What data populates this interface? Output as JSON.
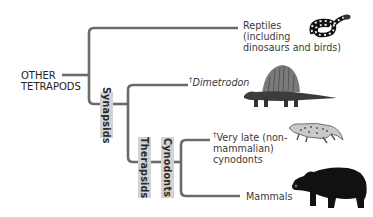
{
  "diagram": {
    "type": "phylogenetic-tree",
    "root": {
      "label_line1": "OTHER",
      "label_line2": "TETRAPODS"
    },
    "clades": [
      {
        "name": "Synapsids"
      },
      {
        "name": "Therapsids"
      },
      {
        "name": "Cynodonts"
      }
    ],
    "tips": [
      {
        "id": "reptiles",
        "extinct": false,
        "lines": [
          "Reptiles",
          "(including",
          "dinosaurs and birds)"
        ],
        "image": "snake"
      },
      {
        "id": "dimetrodon",
        "extinct": true,
        "dagger": "†",
        "lines": [
          "Dimetrodon"
        ],
        "italic": true,
        "image": "dimetrodon"
      },
      {
        "id": "very-late-cynodonts",
        "extinct": true,
        "dagger": "†",
        "lines": [
          "Very late (non-",
          "mammalian)",
          "cynodonts"
        ],
        "image": "cynodont"
      },
      {
        "id": "mammals",
        "extinct": false,
        "lines": [
          "Mammals"
        ],
        "image": "bear"
      }
    ],
    "colors": {
      "branch": "#6b6b6b",
      "clade_box": "#d3d3d3",
      "text": "#3a3a3a"
    }
  }
}
